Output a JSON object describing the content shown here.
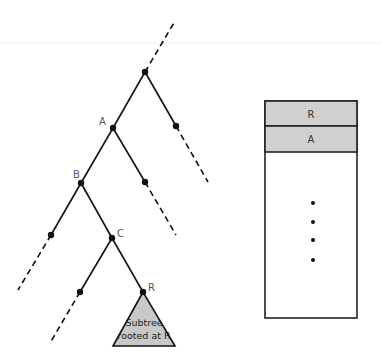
{
  "tree": {
    "node_labels": {
      "a": "A",
      "b": "B",
      "c": "C",
      "r": "R"
    },
    "subtree": {
      "line1": "Subtree",
      "line2": "rooted at R",
      "fill": "#c8c8c8"
    }
  },
  "stack": {
    "frames": [
      "R",
      "A"
    ],
    "frame_fill": "#d0d0d0",
    "ellipsis_dots": 4
  }
}
